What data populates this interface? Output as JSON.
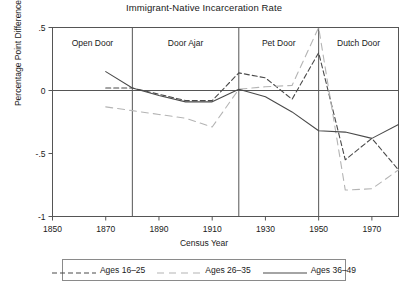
{
  "chart_data": {
    "type": "line",
    "title": "Immigrant-Native Incarceration Rate",
    "xlabel": "Census Year",
    "ylabel": "Percentage Point Difference",
    "xlim": [
      1850,
      1980
    ],
    "ylim": [
      -1.0,
      0.5
    ],
    "xticks": [
      1850,
      1870,
      1890,
      1910,
      1930,
      1950,
      1970
    ],
    "yticks": [
      0.5,
      0,
      -0.5,
      -1
    ],
    "ytick_labels": [
      ".5",
      "0",
      "-.5",
      "-1"
    ],
    "grid": false,
    "legend_position": "below",
    "panels": [
      {
        "label": "Open Door",
        "start": 1850,
        "end": 1880
      },
      {
        "label": "Door Ajar",
        "start": 1880,
        "end": 1920
      },
      {
        "label": "Pet Door",
        "start": 1920,
        "end": 1950
      },
      {
        "label": "Dutch Door",
        "start": 1950,
        "end": 1980
      }
    ],
    "panel_dividers": [
      1880,
      1920,
      1950
    ],
    "series": [
      {
        "name": "Ages 16-25",
        "style": "dashed-short",
        "color": "#4a4a4a",
        "x": [
          1870,
          1880,
          1890,
          1900,
          1910,
          1920,
          1930,
          1940,
          1950,
          1960,
          1970,
          1980
        ],
        "values": [
          0.02,
          0.02,
          -0.03,
          -0.08,
          -0.08,
          0.14,
          0.1,
          -0.07,
          0.3,
          -0.55,
          -0.38,
          -0.63
        ]
      },
      {
        "name": "Ages 26-35",
        "style": "dashed-long",
        "color": "#b4b4b4",
        "x": [
          1870,
          1880,
          1890,
          1900,
          1910,
          1920,
          1930,
          1940,
          1950,
          1960,
          1970,
          1980
        ],
        "values": [
          -0.13,
          -0.16,
          -0.19,
          -0.22,
          -0.29,
          0.01,
          0.03,
          0.04,
          0.5,
          -0.79,
          -0.78,
          -0.63
        ]
      },
      {
        "name": "Ages 36-49",
        "style": "solid",
        "color": "#4a4a4a",
        "x": [
          1870,
          1880,
          1890,
          1900,
          1910,
          1920,
          1930,
          1940,
          1950,
          1960,
          1970,
          1980
        ],
        "values": [
          0.15,
          0.02,
          -0.04,
          -0.09,
          -0.09,
          0.01,
          -0.05,
          -0.17,
          -0.32,
          -0.33,
          -0.38,
          -0.27
        ]
      }
    ]
  },
  "legend": {
    "items": [
      {
        "label": "Ages 16–25"
      },
      {
        "label": "Ages 26–35"
      },
      {
        "label": "Ages 36–49"
      }
    ]
  }
}
